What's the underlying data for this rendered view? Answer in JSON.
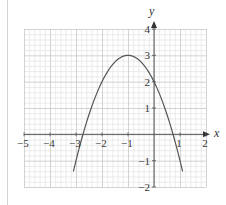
{
  "chart_data": {
    "type": "line",
    "title": "",
    "xlabel": "x",
    "ylabel": "y",
    "xlim": [
      -5,
      2
    ],
    "ylim": [
      -2,
      4
    ],
    "grid": true,
    "grid_minor_per_unit": 5,
    "x_ticks": [
      -5,
      -4,
      -3,
      -2,
      -1,
      1,
      2
    ],
    "x_tick_labels": [
      "−5",
      "−4",
      "−3",
      "−2",
      "−1",
      "1",
      "2"
    ],
    "y_ticks": [
      -2,
      -1,
      1,
      2,
      3,
      4
    ],
    "y_tick_labels": [
      "−2",
      "−1",
      "1",
      "2",
      "3",
      "4"
    ],
    "series": [
      {
        "name": "y = 3 − (x + 1)²",
        "function": "3-(x+1)^2",
        "x_range": [
          -3.1,
          1.1
        ],
        "vertex": [
          -1,
          3
        ],
        "y_intercept": 2,
        "x_intercepts": [
          -2.73,
          0.73
        ],
        "color": "#555555"
      }
    ],
    "legend": null
  },
  "colors": {
    "minor_grid": "#e6e6e6",
    "major_grid": "#c8c8c8",
    "axis": "#555555",
    "curve": "#555555"
  }
}
